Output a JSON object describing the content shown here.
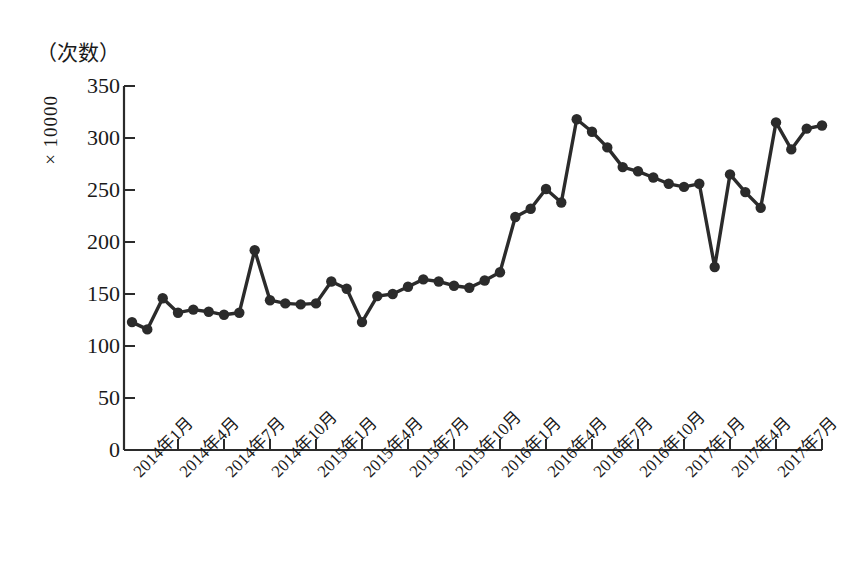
{
  "chart_data": {
    "type": "line",
    "title": "",
    "subtitle": "",
    "unit_note": "（次数）",
    "ylabel": "×10000",
    "xlabel": "",
    "ylim": [
      0,
      350
    ],
    "yticks": [
      0,
      50,
      100,
      150,
      200,
      250,
      300,
      350
    ],
    "ytick_labels": [
      "0",
      "50",
      "100",
      "150",
      "200",
      "250",
      "300",
      "350"
    ],
    "grid": false,
    "legend": null,
    "marker": "filled-circle",
    "line_color": "#2b2b2b",
    "categories": [
      "2014年1月",
      "2014年2月",
      "2014年3月",
      "2014年4月",
      "2014年5月",
      "2014年6月",
      "2014年7月",
      "2014年8月",
      "2014年9月",
      "2014年10月",
      "2014年11月",
      "2014年12月",
      "2015年1月",
      "2015年2月",
      "2015年3月",
      "2015年4月",
      "2015年5月",
      "2015年6月",
      "2015年7月",
      "2015年8月",
      "2015年9月",
      "2015年10月",
      "2015年11月",
      "2015年12月",
      "2016年1月",
      "2016年2月",
      "2016年3月",
      "2016年4月",
      "2016年5月",
      "2016年6月",
      "2016年7月",
      "2016年8月",
      "2016年9月",
      "2016年10月",
      "2016年11月",
      "2016年12月",
      "2017年1月",
      "2017年2月",
      "2017年3月",
      "2017年4月",
      "2017年5月",
      "2017年6月",
      "2017年7月"
    ],
    "xtick_labels": [
      "2014年1月",
      "2014年4月",
      "2014年7月",
      "2014年10月",
      "2015年1月",
      "2015年4月",
      "2015年7月",
      "2015年10月",
      "2016年1月",
      "2016年4月",
      "2016年7月",
      "2016年10月",
      "2017年1月",
      "2017年4月",
      "2017年7月"
    ],
    "xtick_indices": [
      0,
      3,
      6,
      9,
      12,
      15,
      18,
      21,
      24,
      27,
      30,
      33,
      36,
      39,
      42
    ],
    "values": [
      123,
      116,
      146,
      132,
      135,
      133,
      130,
      132,
      192,
      144,
      141,
      140,
      141,
      162,
      155,
      123,
      148,
      150,
      157,
      164,
      162,
      158,
      156,
      163,
      171,
      224,
      232,
      251,
      238,
      318,
      306,
      291,
      272,
      268,
      262,
      256,
      253,
      256,
      176,
      265,
      248,
      233,
      315
    ],
    "values_tail": [
      289,
      309,
      312
    ],
    "full_values": [
      123,
      116,
      146,
      132,
      135,
      133,
      130,
      132,
      192,
      144,
      141,
      140,
      141,
      162,
      155,
      123,
      148,
      150,
      157,
      164,
      162,
      158,
      156,
      163,
      171,
      224,
      232,
      251,
      238,
      318,
      306,
      291,
      272,
      268,
      262,
      256,
      253,
      256,
      176,
      265,
      248,
      233,
      315,
      289,
      309,
      312
    ]
  },
  "axes": {
    "y_unit_caption": "（次数）",
    "y_axis_title": "×10000"
  }
}
